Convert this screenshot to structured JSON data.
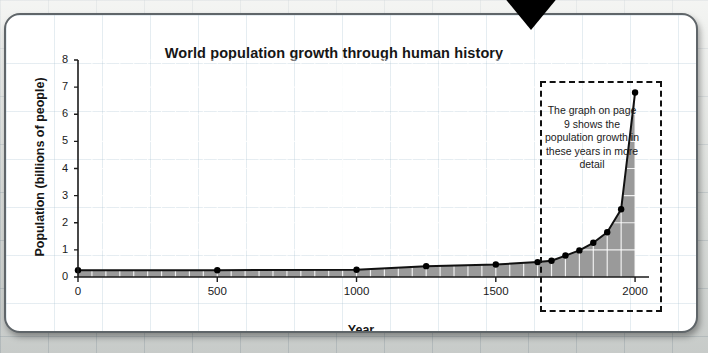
{
  "figure": {
    "arrow_icon": "down-arrow-icon"
  },
  "chart_data": {
    "type": "area",
    "title": "World population growth through human history",
    "xlabel": "Year",
    "ylabel": "Population (billions of people)",
    "xlim": [
      0,
      2050
    ],
    "ylim": [
      0,
      8
    ],
    "xticks": [
      0,
      500,
      1000,
      1500,
      2000
    ],
    "xtick_labels": [
      "0",
      "500",
      "1000",
      "1500",
      "2000"
    ],
    "x_minor_tick_step": 50,
    "yticks": [
      0,
      1,
      2,
      3,
      4,
      5,
      6,
      7,
      8
    ],
    "ytick_labels": [
      "0",
      "1",
      "2",
      "3",
      "4",
      "5",
      "6",
      "7",
      "8"
    ],
    "grid": true,
    "legend": "none",
    "x": [
      0,
      500,
      1000,
      1250,
      1500,
      1650,
      1700,
      1750,
      1800,
      1850,
      1900,
      1950,
      2000
    ],
    "values": [
      0.25,
      0.25,
      0.27,
      0.4,
      0.46,
      0.55,
      0.6,
      0.79,
      0.98,
      1.26,
      1.65,
      2.5,
      6.8
    ],
    "series_name": "World population",
    "fill_color": "#9a9a9a",
    "line_color": "#111111",
    "marker": "circle",
    "annotations": [
      {
        "text": "The graph on page 9 shows the population growth in these years in more detail",
        "box_style": "dashed",
        "x_range": [
          1650,
          2050
        ],
        "y_range": [
          0,
          8
        ]
      }
    ]
  }
}
